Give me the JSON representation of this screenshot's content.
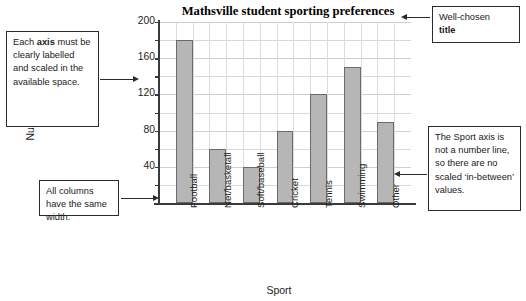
{
  "chart_data": {
    "type": "bar",
    "title": "Mathsville student sporting preferences",
    "xlabel": "Sport",
    "ylabel": "Number preferring",
    "categories": [
      "Football",
      "Net/basketall",
      "Soft/baseball",
      "Cricket",
      "Tennis",
      "Swimming",
      "Other"
    ],
    "values": [
      180,
      60,
      40,
      80,
      120,
      150,
      90
    ],
    "ylim": [
      0,
      200
    ],
    "yticks": [
      40,
      80,
      120,
      160,
      200
    ],
    "ytick_labels": [
      "40",
      "80",
      "120",
      "160",
      "200"
    ],
    "minor_tick_step": 20,
    "grid": true,
    "legend": "none",
    "bar_color": "#b6b6b6",
    "bar_border_color": "#6a6a6a"
  },
  "annotations": {
    "axis_box": {
      "line1_a": "Each ",
      "line1_b": "axis",
      "rest": " must be clearly labelled and scaled in the available space."
    },
    "title_box": {
      "line1": "Well-chosen",
      "line2": "title"
    },
    "sport_box": {
      "text": "The Sport axis is not a number line, so there are no scaled ‘in-between’ values."
    },
    "columns_box": {
      "text": "All columns have the same width."
    }
  }
}
